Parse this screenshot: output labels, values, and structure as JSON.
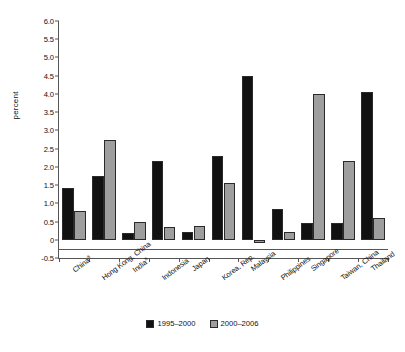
{
  "chart_data": {
    "type": "bar",
    "title": "",
    "xlabel": "",
    "ylabel": "percent",
    "ylim": [
      -0.5,
      6.0
    ],
    "ytick_labels": [
      "6.0",
      "5.5",
      "5.0",
      "4.5",
      "4.0",
      "3.5",
      "3.0",
      "2.5",
      "2.0",
      "1.5",
      "1.0",
      "0.5",
      "0",
      "-0.5"
    ],
    "ytick_values": [
      6.0,
      5.5,
      5.0,
      4.5,
      4.0,
      3.5,
      3.0,
      2.5,
      2.0,
      1.5,
      1.0,
      0.5,
      0.0,
      -0.5
    ],
    "grid": false,
    "legend_position": "bottom",
    "categories": [
      "China",
      "Hong Kong, China",
      "India",
      "Indonesia",
      "Japan",
      "Korea, Rep.",
      "Malaysia",
      "Philippines",
      "Singapore",
      "Taiwan, China",
      "Thailand"
    ],
    "category_footnote_markers": [
      "a",
      "",
      "a",
      "",
      "",
      "",
      "",
      "",
      "",
      "",
      ""
    ],
    "series": [
      {
        "name": "1995–2000",
        "color": "#111111",
        "values": [
          1.43,
          1.75,
          0.18,
          2.15,
          0.2,
          2.3,
          4.48,
          0.85,
          0.45,
          0.45,
          4.05
        ]
      },
      {
        "name": "2000–2006",
        "color": "#9e9e9e",
        "values": [
          0.8,
          2.75,
          0.48,
          0.35,
          0.38,
          1.55,
          -0.08,
          0.2,
          4.0,
          2.15,
          0.6
        ]
      }
    ]
  },
  "legend": {
    "items": [
      {
        "label": "1995–2000"
      },
      {
        "label": "2000–2006"
      }
    ]
  },
  "footnote": {
    "text": ""
  }
}
